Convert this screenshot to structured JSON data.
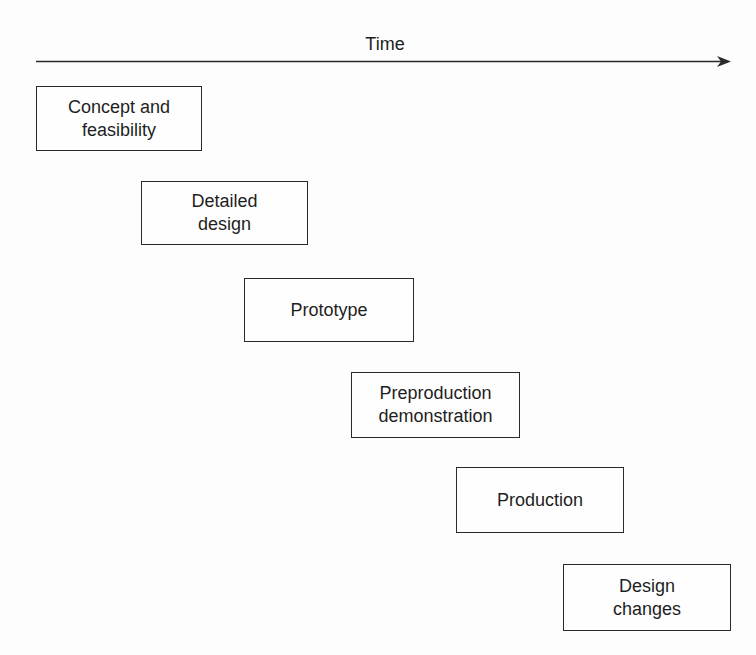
{
  "diagram": {
    "axis": {
      "label": "Time",
      "direction": "left-to-right",
      "color": "#2a2a2a"
    },
    "stages": [
      {
        "id": "concept",
        "label": "Concept and\nfeasibility",
        "left": 36,
        "top": 86,
        "width": 166,
        "height": 65
      },
      {
        "id": "detailed-design",
        "label": "Detailed\ndesign",
        "left": 141,
        "top": 181,
        "width": 167,
        "height": 64
      },
      {
        "id": "prototype",
        "label": "Prototype",
        "left": 244,
        "top": 278,
        "width": 170,
        "height": 64
      },
      {
        "id": "preproduction",
        "label": "Preproduction\ndemonstration",
        "left": 351,
        "top": 372,
        "width": 169,
        "height": 66
      },
      {
        "id": "production",
        "label": "Production",
        "left": 456,
        "top": 467,
        "width": 168,
        "height": 66
      },
      {
        "id": "design-changes",
        "label": "Design\nchanges",
        "left": 563,
        "top": 564,
        "width": 168,
        "height": 67
      }
    ]
  }
}
